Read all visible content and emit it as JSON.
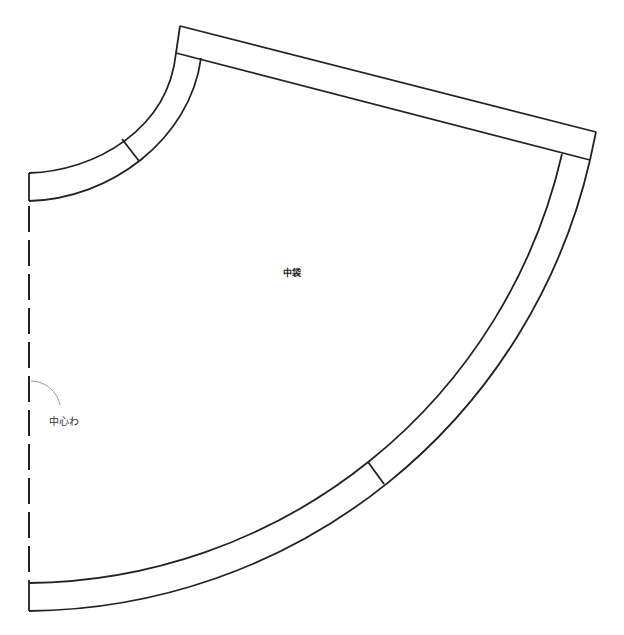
{
  "diagram": {
    "type": "sewing-pattern",
    "piece_name": "中袋",
    "fold_line_label": "中心わ",
    "colors": {
      "outline": "#222222",
      "fold_arc": "#999999",
      "background": "#ffffff"
    },
    "elements": {
      "neckline_band": "curved seam allowance band at top-left with notch",
      "hem_band": "curved seam allowance band along bottom arc with notch",
      "side_band": "straight seam allowance band along top edge",
      "fold_line": "dashed vertical line on left edge (center fold)"
    }
  }
}
